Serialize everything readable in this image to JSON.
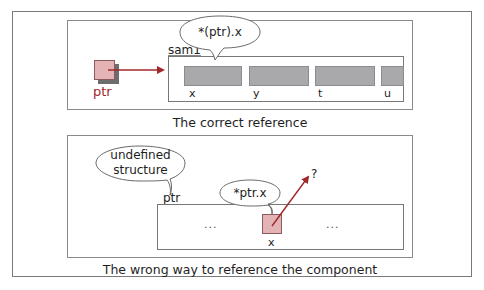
{
  "colors": {
    "pointer_fill": "#e3b3b6",
    "pointer_border": "#8a5a5c",
    "arrow": "#a0282a",
    "field_fill": "#a9a9ab",
    "border": "#7a7a7a"
  },
  "top_panel": {
    "pointer_label": "ptr",
    "struct_label": "sam1",
    "bubble_text": "*(ptr).x",
    "fields": [
      {
        "name": "x"
      },
      {
        "name": "y"
      },
      {
        "name": "t"
      },
      {
        "name": "u"
      }
    ],
    "caption": "The correct reference"
  },
  "bottom_panel": {
    "bubble_undefined_line1": "undefined",
    "bubble_undefined_line2": "structure",
    "pointer_label": "ptr",
    "bubble_text": "*ptr.x",
    "left_ellipsis": "...",
    "right_ellipsis": "...",
    "component_label": "x",
    "question_mark": "?",
    "caption": "The wrong way to reference the component"
  }
}
